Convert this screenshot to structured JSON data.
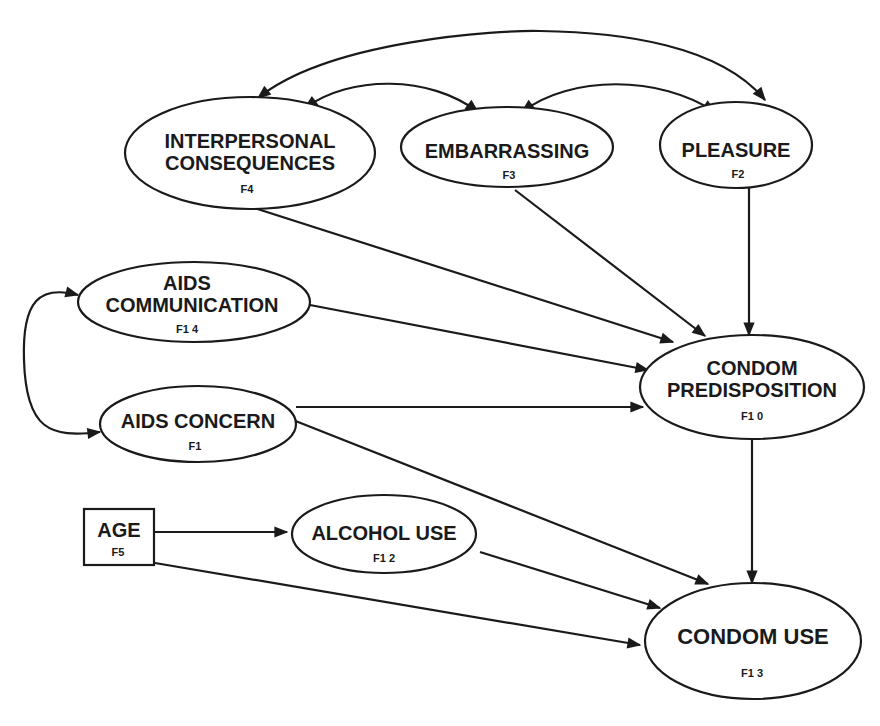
{
  "nodes": {
    "interpersonal": {
      "lines": [
        "INTERPERSONAL",
        "CONSEQUENCES"
      ],
      "code": "F4",
      "shape": "ellipse"
    },
    "embarrassing": {
      "lines": [
        "EMBARRASSING"
      ],
      "code": "F3",
      "shape": "ellipse"
    },
    "pleasure": {
      "lines": [
        "PLEASURE"
      ],
      "code": "F2",
      "shape": "ellipse"
    },
    "aids_communication": {
      "lines": [
        "AIDS",
        "COMMUNICATION"
      ],
      "code": "F1 4",
      "shape": "ellipse"
    },
    "condom_predisposition": {
      "lines": [
        "CONDOM",
        "PREDISPOSITION"
      ],
      "code": "F1 0",
      "shape": "ellipse"
    },
    "aids_concern": {
      "lines": [
        "AIDS CONCERN"
      ],
      "code": "F1",
      "shape": "ellipse"
    },
    "age": {
      "lines": [
        "AGE"
      ],
      "code": "F5",
      "shape": "rectangle"
    },
    "alcohol_use": {
      "lines": [
        "ALCOHOL USE"
      ],
      "code": "F1 2",
      "shape": "ellipse"
    },
    "condom_use": {
      "lines": [
        "CONDOM USE"
      ],
      "code": "F1 3",
      "shape": "ellipse"
    }
  },
  "edges": [
    {
      "from": "interpersonal",
      "to": "pleasure",
      "type": "bidirectional-correlation"
    },
    {
      "from": "interpersonal",
      "to": "embarrassing",
      "type": "bidirectional-correlation"
    },
    {
      "from": "embarrassing",
      "to": "pleasure",
      "type": "bidirectional-correlation"
    },
    {
      "from": "aids_communication",
      "to": "aids_concern",
      "type": "bidirectional-correlation"
    },
    {
      "from": "interpersonal",
      "to": "condom_predisposition",
      "type": "directed"
    },
    {
      "from": "embarrassing",
      "to": "condom_predisposition",
      "type": "directed"
    },
    {
      "from": "pleasure",
      "to": "condom_predisposition",
      "type": "directed"
    },
    {
      "from": "aids_communication",
      "to": "condom_predisposition",
      "type": "directed"
    },
    {
      "from": "aids_concern",
      "to": "condom_predisposition",
      "type": "directed"
    },
    {
      "from": "aids_concern",
      "to": "condom_use",
      "type": "directed"
    },
    {
      "from": "condom_predisposition",
      "to": "condom_use",
      "type": "directed"
    },
    {
      "from": "age",
      "to": "alcohol_use",
      "type": "directed"
    },
    {
      "from": "age",
      "to": "condom_use",
      "type": "directed"
    },
    {
      "from": "alcohol_use",
      "to": "condom_use",
      "type": "directed"
    }
  ],
  "colors": {
    "ink": "#1a1a1a",
    "background": "#ffffff"
  }
}
